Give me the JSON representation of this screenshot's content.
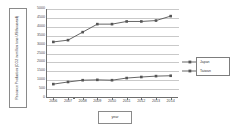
{
  "chart": {
    "type": "line",
    "title": "",
    "ylabel": "Resource Production (CO2 in million tons US/thousand)",
    "xlabel": "year"
  },
  "chart_data": {
    "type": "line",
    "title": "",
    "xlabel": "year",
    "ylabel": "Resource Production (CO2 in million tons US/thousand)",
    "categories": [
      "2006",
      "2007",
      "2008",
      "2009",
      "2010",
      "2011",
      "2012",
      "2013",
      "2014"
    ],
    "ylim": [
      0,
      5000
    ],
    "yticks": [
      0,
      500,
      1000,
      1500,
      2000,
      2500,
      3000,
      3500,
      4000,
      4500,
      5000
    ],
    "grid": true,
    "legend_position": "right",
    "series": [
      {
        "name": "Japan",
        "color": "#555555",
        "marker": "square",
        "values": [
          3150,
          3250,
          3700,
          4150,
          4150,
          4300,
          4300,
          4350,
          4600
        ]
      },
      {
        "name": "Taiwan",
        "color": "#555555",
        "marker": "square",
        "values": [
          780,
          900,
          1000,
          1020,
          1000,
          1120,
          1180,
          1230,
          1250
        ]
      }
    ]
  },
  "legend": {
    "items": [
      {
        "label": "Japan"
      },
      {
        "label": "Taiwan"
      }
    ]
  }
}
